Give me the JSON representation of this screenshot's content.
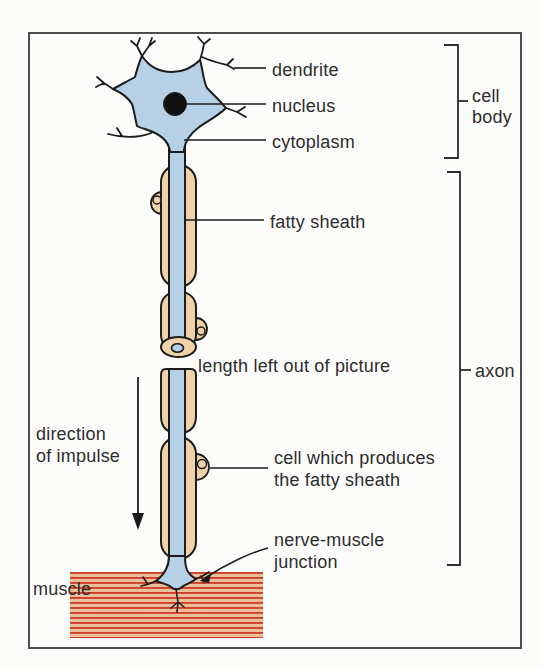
{
  "figure": {
    "labels": {
      "dendrite": "dendrite",
      "nucleus": "nucleus",
      "cytoplasm": "cytoplasm",
      "cell_body": "cell\nbody",
      "fatty_sheath": "fatty sheath",
      "length_note": "length left out of picture",
      "axon": "axon",
      "direction_of_impulse": "direction\nof impulse",
      "producer_cell": "cell which produces\nthe fatty sheath",
      "nerve_muscle_junction": "nerve-muscle\njunction",
      "muscle": "muscle"
    },
    "colors": {
      "cell_fill": "#b6d0e5",
      "sheath_fill": "#efd2a8",
      "muscle_fill": "#e9c099",
      "muscle_stripe": "#d0402c",
      "outline": "#1c1c1c",
      "text": "#2d2d2d",
      "border": "#4d4d4d",
      "background": "#fcfcfa"
    }
  }
}
